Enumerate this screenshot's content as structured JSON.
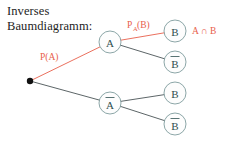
{
  "title": {
    "line1": "Inverses",
    "line2": "Baumdiagramm:"
  },
  "colors": {
    "highlight": "#e8604c",
    "branch": "#4a5456",
    "node_stroke": "#6e8f90",
    "node_text": "#2f4f4f",
    "title_text": "#1d1d1d",
    "background": "#ffffff",
    "root_dot": "#111111"
  },
  "labels": {
    "p_a": "P(A)",
    "p_a_b_main": "P",
    "p_a_b_sub": "A",
    "p_a_b_rest": "(B)",
    "outcome": "A ∩ B"
  },
  "nodes": [
    {
      "id": "root",
      "label": "",
      "overline": false,
      "x": 30,
      "y": 81,
      "r": 0
    },
    {
      "id": "a",
      "label": "A",
      "overline": false,
      "x": 110,
      "y": 42,
      "r": 11
    },
    {
      "id": "abar",
      "label": "A",
      "overline": true,
      "x": 110,
      "y": 103,
      "r": 11
    },
    {
      "id": "b1",
      "label": "B",
      "overline": false,
      "x": 175,
      "y": 31,
      "r": 11
    },
    {
      "id": "bbar1",
      "label": "B",
      "overline": true,
      "x": 175,
      "y": 62,
      "r": 11
    },
    {
      "id": "b2",
      "label": "B",
      "overline": false,
      "x": 175,
      "y": 93,
      "r": 11
    },
    {
      "id": "bbar2",
      "label": "B",
      "overline": true,
      "x": 175,
      "y": 124,
      "r": 11
    }
  ],
  "edges": [
    {
      "from": "root",
      "to": "a",
      "highlighted": true
    },
    {
      "from": "root",
      "to": "abar",
      "highlighted": false
    },
    {
      "from": "a",
      "to": "b1",
      "highlighted": true
    },
    {
      "from": "a",
      "to": "bbar1",
      "highlighted": false
    },
    {
      "from": "abar",
      "to": "b2",
      "highlighted": false
    },
    {
      "from": "abar",
      "to": "bbar2",
      "highlighted": false
    }
  ]
}
